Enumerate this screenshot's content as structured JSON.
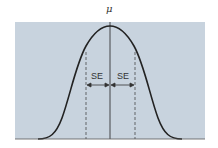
{
  "diagram": {
    "type": "normal distribution curve",
    "title": "",
    "mean_label": "μ",
    "left_interval_label": "SE",
    "right_interval_label": "SE",
    "background_color": "#c8d3de",
    "curve_color": "#222222"
  }
}
